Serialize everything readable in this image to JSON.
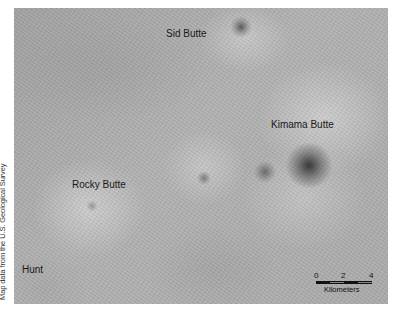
{
  "map": {
    "type": "shaded-relief",
    "labels": [
      {
        "name": "Sid Butte",
        "x": 152,
        "y": 20
      },
      {
        "name": "Kimama Butte",
        "x": 257,
        "y": 111
      },
      {
        "name": "Rocky Butte",
        "x": 58,
        "y": 171
      },
      {
        "name": "Hunt",
        "x": 8,
        "y": 256
      }
    ],
    "scale_bar": {
      "ticks": [
        "0",
        "2",
        "4"
      ],
      "unit": "Kilometers"
    },
    "credit": "Map data from the U.S. Geological Survey",
    "colors": {
      "relief_base": "#acacac",
      "label_text": "#1a1a1a",
      "vent_dark": "#3a3a3a"
    }
  }
}
